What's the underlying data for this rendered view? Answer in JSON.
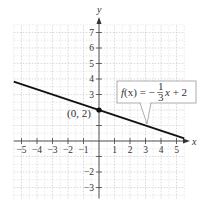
{
  "chart_data": {
    "type": "line",
    "title": "",
    "xlabel": "x",
    "ylabel": "y",
    "xlim": [
      -5.5,
      5.5
    ],
    "ylim": [
      -3.7,
      7.5
    ],
    "grid": true,
    "x_ticks": [
      -5,
      -4,
      -3,
      -2,
      -1,
      1,
      2,
      3,
      4,
      5
    ],
    "y_ticks": [
      -3,
      -2,
      -1,
      1,
      2,
      3,
      4,
      5,
      6,
      7
    ],
    "x_tick_labels": [
      "−5",
      "−4",
      "−3",
      "−2",
      "−1",
      "1",
      "2",
      "3",
      "4",
      "5"
    ],
    "y_tick_labels": [
      "−3",
      "−2",
      "",
      "",
      "",
      "3",
      "4",
      "5",
      "6",
      "7"
    ],
    "series": [
      {
        "name": "f(x) = −(1/3)x + 2",
        "slope": -0.3333,
        "intercept": 2,
        "x": [
          -5.5,
          5.5
        ],
        "y": [
          3.833,
          0.167
        ]
      }
    ],
    "annotations": [
      {
        "type": "point",
        "x": 0,
        "y": 2,
        "label": "(0, 2)"
      },
      {
        "type": "callout",
        "text": "f(x) = −⅓x + 2",
        "points_to": [
          3,
          1
        ]
      }
    ]
  },
  "labels": {
    "x_axis": "x",
    "y_axis": "y",
    "point": "(0, 2)",
    "formula_f": "f",
    "formula_x": "(x)",
    "formula_eq": " = −",
    "formula_num": "1",
    "formula_den": "3",
    "formula_tail_x": "x",
    "formula_tail": " + 2"
  },
  "colors": {
    "line": "#111111",
    "grid": "#c8c8c8",
    "axis": "#555555",
    "callout_border": "#999999"
  }
}
